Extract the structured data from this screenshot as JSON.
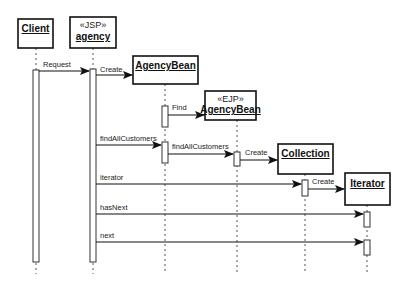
{
  "diagram": {
    "type": "sequence",
    "participants": [
      {
        "id": "client",
        "name": "Client",
        "stereotype": ""
      },
      {
        "id": "agency",
        "name": "agency",
        "stereotype": "«JSP»"
      },
      {
        "id": "agencybean",
        "name": "AgencyBean",
        "stereotype": ""
      },
      {
        "id": "ejpagencybean",
        "name": "AgencyBean",
        "stereotype": "«EJP»"
      },
      {
        "id": "collection",
        "name": "Collection",
        "stereotype": ""
      },
      {
        "id": "iterator",
        "name": "Iterator",
        "stereotype": ""
      }
    ],
    "messages": [
      {
        "from": "client",
        "to": "agency",
        "label": "Request"
      },
      {
        "from": "agency",
        "to": "agencybean",
        "label": "Create"
      },
      {
        "from": "agencybean",
        "to": "ejpagencybean",
        "label": "Find"
      },
      {
        "from": "agency",
        "to": "agencybean",
        "label": "findAllCustomers"
      },
      {
        "from": "agencybean",
        "to": "ejpagencybean",
        "label": "findAllCustomers"
      },
      {
        "from": "ejpagencybean",
        "to": "collection",
        "label": "Create"
      },
      {
        "from": "agency",
        "to": "collection",
        "label": "iterator"
      },
      {
        "from": "collection",
        "to": "iterator",
        "label": "Create"
      },
      {
        "from": "agency",
        "to": "iterator",
        "label": "hasNext"
      },
      {
        "from": "agency",
        "to": "iterator",
        "label": "next"
      }
    ]
  }
}
